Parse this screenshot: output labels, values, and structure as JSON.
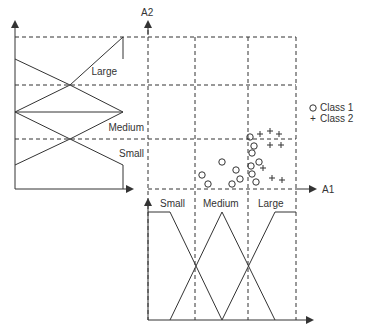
{
  "diagram": {
    "axes": {
      "a1": "A1",
      "a2": "A2"
    },
    "a2_mf_labels": {
      "large": "Large",
      "medium": "Medium",
      "small": "Small"
    },
    "a1_mf_labels": {
      "small": "Small",
      "medium": "Medium",
      "large": "Large"
    },
    "legend": {
      "class1": {
        "symbol": "O",
        "label": "Class 1"
      },
      "class2": {
        "symbol": "+",
        "label": "Class 2"
      }
    },
    "class1_points": [
      [
        202,
        175
      ],
      [
        236,
        170
      ],
      [
        259,
        162
      ],
      [
        222,
        162
      ],
      [
        240,
        179
      ],
      [
        208,
        184
      ],
      [
        232,
        184
      ],
      [
        252,
        174
      ],
      [
        256,
        182
      ],
      [
        251,
        166
      ],
      [
        252,
        153
      ],
      [
        254,
        146
      ],
      [
        250,
        137
      ]
    ],
    "class2_points": [
      [
        260,
        134
      ],
      [
        270,
        131
      ],
      [
        279,
        134
      ],
      [
        270,
        145
      ],
      [
        281,
        145
      ],
      [
        263,
        168
      ],
      [
        272,
        178
      ],
      [
        282,
        180
      ]
    ],
    "colors": {
      "line": "#333333",
      "background": "#ffffff"
    }
  }
}
